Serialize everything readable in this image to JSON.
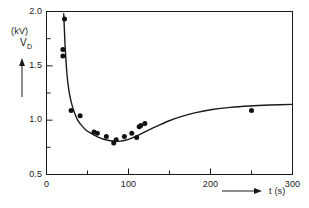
{
  "figure": {
    "background_color": "#ffffff",
    "line_color": "#1a1a1a",
    "marker_color": "#111111"
  },
  "axes": {
    "y": {
      "symbol": "V",
      "subscript": "D",
      "unit": "(kV)",
      "min": 0.5,
      "max": 2.0,
      "major_ticks": [
        "2.0",
        "1.5",
        "1.0",
        "0.5"
      ],
      "major_tick_values": [
        2.0,
        1.5,
        1.0,
        0.5
      ],
      "minor_tick_values": [
        1.75,
        1.25,
        0.75
      ],
      "arrow_direction": "up"
    },
    "x": {
      "symbol": "t (s)",
      "min": 0,
      "max": 300,
      "major_ticks": [
        "0",
        "100",
        "200",
        "300"
      ],
      "major_tick_values": [
        0,
        100,
        200,
        300
      ],
      "minor_tick_values": [
        50,
        150,
        250
      ],
      "arrow_direction": "right"
    }
  },
  "chart_data": {
    "type": "scatter",
    "title": "",
    "subtitle": "",
    "xlabel": "t (s)",
    "ylabel": "V_D (kV)",
    "xlim": [
      0,
      300
    ],
    "ylim": [
      0.5,
      2.0
    ],
    "grid": false,
    "legend": null,
    "series": [
      {
        "name": "measurements",
        "style": "points",
        "x": [
          22,
          20,
          20,
          30,
          41,
          58,
          62,
          73,
          82,
          85,
          95,
          104,
          110,
          113,
          115,
          120,
          250
        ],
        "y": [
          1.93,
          1.65,
          1.59,
          1.09,
          1.04,
          0.89,
          0.88,
          0.85,
          0.79,
          0.82,
          0.85,
          0.88,
          0.84,
          0.94,
          0.95,
          0.97,
          1.09
        ]
      },
      {
        "name": "fitted curve",
        "style": "line",
        "x": [
          21,
          22,
          23,
          25,
          27,
          30,
          34,
          38,
          43,
          48,
          54,
          60,
          66,
          72,
          78,
          84,
          90,
          96,
          104,
          112,
          122,
          134,
          148,
          164,
          182,
          202,
          224,
          248,
          272,
          300
        ],
        "y": [
          1.98,
          1.8,
          1.64,
          1.42,
          1.29,
          1.17,
          1.07,
          1.0,
          0.95,
          0.91,
          0.88,
          0.855,
          0.835,
          0.82,
          0.81,
          0.805,
          0.807,
          0.815,
          0.835,
          0.862,
          0.9,
          0.943,
          0.99,
          1.032,
          1.069,
          1.098,
          1.118,
          1.131,
          1.139,
          1.145
        ]
      }
    ]
  }
}
